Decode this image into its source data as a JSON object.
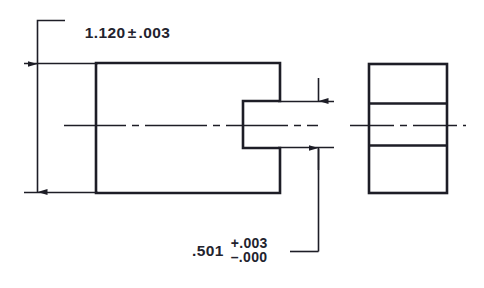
{
  "drawing": {
    "title": "Slotted block engineering drawing",
    "background_color": "#ffffff",
    "line_color": "#1d1d26",
    "text_color": "#23232e",
    "dimensions": {
      "vertical_overall": {
        "name": "overall-height",
        "nominal": "1.120",
        "tolerance_symbol": "±",
        "tolerance": ".003",
        "full_text": "1.120 ± .003"
      },
      "slot_width": {
        "name": "slot-width",
        "nominal": ".501",
        "tolerance_upper": "+.003",
        "tolerance_lower": "–.000",
        "full_text": ".501 +.003 / -.000"
      }
    },
    "views": {
      "front": {
        "name": "front-view",
        "description": "Slotted block profile with open slot on right side"
      },
      "side": {
        "name": "side-view",
        "description": "Rectangular end view with two horizontal division lines"
      }
    },
    "annotations": {
      "centerline_front": "front-view-centerline",
      "centerline_side": "side-view-centerline"
    }
  }
}
